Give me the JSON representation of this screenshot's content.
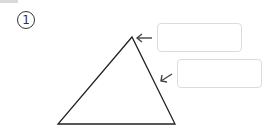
{
  "problem": {
    "number_label": "1"
  },
  "diagram": {
    "shape": "triangle",
    "answer_boxes": [
      {
        "value": "",
        "points_to": "vertex"
      },
      {
        "value": "",
        "points_to": "side"
      }
    ]
  }
}
